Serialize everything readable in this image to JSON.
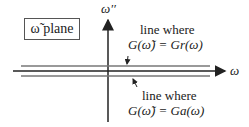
{
  "plane_label": "ω̃  plane",
  "axes": {
    "vertical_label": "ω′′",
    "horizontal_label": "ω"
  },
  "annotations": {
    "upper": {
      "line1": "line where",
      "line2": "G(ω̃) = Gr(ω)"
    },
    "lower": {
      "line1": "line where",
      "line2": "G(ω̃) = Ga(ω)"
    }
  }
}
